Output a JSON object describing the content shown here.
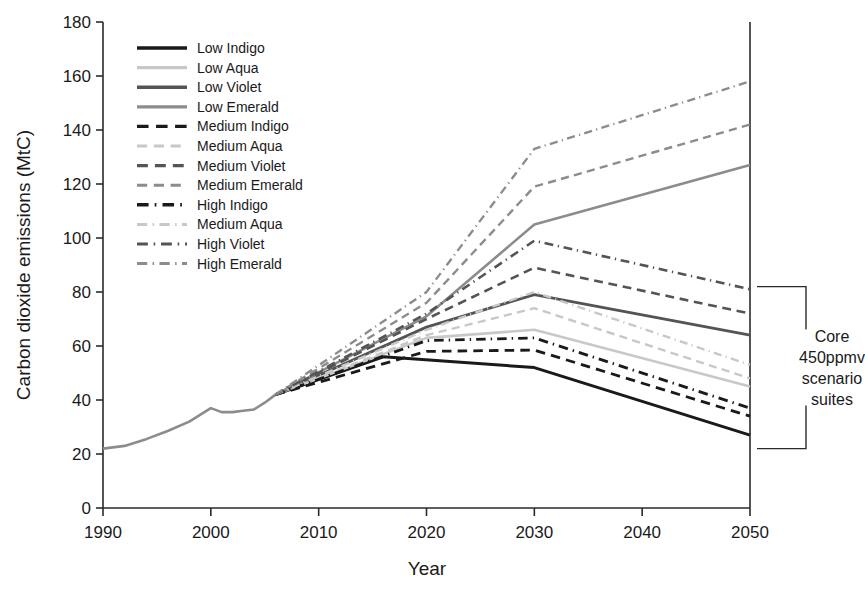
{
  "chart_data": {
    "type": "line",
    "title": "",
    "xlabel": "Year",
    "ylabel": "Carbon dioxide emissions (MtC)",
    "xlim": [
      1990,
      2050
    ],
    "ylim": [
      0,
      180
    ],
    "xticks": [
      1990,
      2000,
      2010,
      2020,
      2030,
      2040,
      2050
    ],
    "yticks": [
      0,
      20,
      40,
      60,
      80,
      100,
      120,
      140,
      160,
      180
    ],
    "grid": false,
    "legend_position": "upper-left-inside",
    "annotations": [
      {
        "name": "core-scenario-bracket",
        "text_lines": [
          "Core",
          "450ppmv",
          "scenario",
          "suites"
        ],
        "y_range": [
          22,
          82
        ]
      }
    ],
    "historical": {
      "name": "Historical",
      "color": "#8c8c8c",
      "dash": "solid",
      "x": [
        1990,
        1992,
        1994,
        1996,
        1998,
        2000,
        2001,
        2002,
        2003,
        2004,
        2005,
        2006
      ],
      "y": [
        22,
        23,
        25.5,
        28.5,
        32,
        37,
        35.5,
        35.5,
        36,
        36.5,
        39,
        42
      ]
    },
    "series": [
      {
        "name": "Low Indigo",
        "color": "#1a1a1a",
        "dash": "solid",
        "width": 3.0,
        "x": [
          2006,
          2016,
          2030,
          2050
        ],
        "y": [
          42,
          56,
          52,
          27
        ]
      },
      {
        "name": "Low Aqua",
        "color": "#c8c8c8",
        "dash": "solid",
        "width": 2.6,
        "x": [
          2006,
          2020,
          2030,
          2050
        ],
        "y": [
          42,
          63,
          66,
          45
        ]
      },
      {
        "name": "Low Violet",
        "color": "#545454",
        "dash": "solid",
        "width": 2.8,
        "x": [
          2006,
          2020,
          2030,
          2050
        ],
        "y": [
          42,
          67,
          79,
          64
        ]
      },
      {
        "name": "Low Emerald",
        "color": "#8c8c8c",
        "dash": "solid",
        "width": 2.6,
        "x": [
          2006,
          2020,
          2030,
          2050
        ],
        "y": [
          42,
          71,
          105,
          127
        ]
      },
      {
        "name": "Medium Indigo",
        "color": "#1a1a1a",
        "dash": "dashed",
        "width": 2.8,
        "x": [
          2006,
          2020,
          2030,
          2050
        ],
        "y": [
          42,
          58,
          58.5,
          34
        ]
      },
      {
        "name": "Medium Aqua",
        "color": "#c8c8c8",
        "dash": "dashed",
        "width": 2.4,
        "x": [
          2006,
          2020,
          2030,
          2050
        ],
        "y": [
          42,
          64,
          74,
          48
        ]
      },
      {
        "name": "Medium Violet",
        "color": "#545454",
        "dash": "dashed",
        "width": 2.6,
        "x": [
          2006,
          2020,
          2030,
          2050
        ],
        "y": [
          42,
          70,
          89,
          72
        ]
      },
      {
        "name": "Medium Emerald",
        "color": "#8c8c8c",
        "dash": "dashed",
        "width": 2.4,
        "x": [
          2006,
          2020,
          2030,
          2050
        ],
        "y": [
          42,
          76,
          119,
          142
        ]
      },
      {
        "name": "High Indigo",
        "color": "#1a1a1a",
        "dash": "dashdot",
        "width": 2.8,
        "x": [
          2006,
          2020,
          2030,
          2050
        ],
        "y": [
          42,
          62,
          63,
          37
        ]
      },
      {
        "name": "Medium Aqua",
        "color": "#c8c8c8",
        "dash": "dashdot",
        "width": 2.4,
        "x": [
          2006,
          2020,
          2030,
          2050
        ],
        "y": [
          42,
          66,
          80,
          53
        ]
      },
      {
        "name": "High Violet",
        "color": "#545454",
        "dash": "dashdot",
        "width": 2.6,
        "x": [
          2006,
          2020,
          2030,
          2050
        ],
        "y": [
          42,
          72,
          99,
          81
        ]
      },
      {
        "name": "High Emerald",
        "color": "#8c8c8c",
        "dash": "dashdot",
        "width": 2.4,
        "x": [
          2006,
          2020,
          2030,
          2050
        ],
        "y": [
          42,
          80,
          133,
          158
        ]
      }
    ]
  },
  "legend": {
    "items": [
      {
        "label": "Low Indigo"
      },
      {
        "label": "Low Aqua"
      },
      {
        "label": "Low Violet"
      },
      {
        "label": "Low Emerald"
      },
      {
        "label": "Medium Indigo"
      },
      {
        "label": "Medium Aqua"
      },
      {
        "label": "Medium Violet"
      },
      {
        "label": "Medium Emerald"
      },
      {
        "label": "High Indigo"
      },
      {
        "label": "Medium Aqua"
      },
      {
        "label": "High Violet"
      },
      {
        "label": "High Emerald"
      }
    ]
  },
  "axes": {
    "y_title": "Carbon dioxide emissions (MtC)",
    "x_title": "Year",
    "y_tick_labels": [
      "0",
      "20",
      "40",
      "60",
      "80",
      "100",
      "120",
      "140",
      "160",
      "180"
    ],
    "x_tick_labels": [
      "1990",
      "2000",
      "2010",
      "2020",
      "2030",
      "2040",
      "2050"
    ]
  },
  "annotation": {
    "line1": "Core",
    "line2": "450ppmv",
    "line3": "scenario",
    "line4": "suites"
  }
}
